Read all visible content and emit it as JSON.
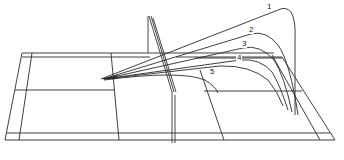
{
  "diagram": {
    "title": "",
    "stroke_color": "#2a2a2a",
    "background": "#ffffff",
    "trajectory_labels": [
      {
        "id": "1",
        "label": "1"
      },
      {
        "id": "2",
        "label": "2"
      },
      {
        "id": "3",
        "label": "3"
      },
      {
        "id": "4",
        "label": "4"
      },
      {
        "id": "5",
        "label": "5"
      }
    ]
  }
}
